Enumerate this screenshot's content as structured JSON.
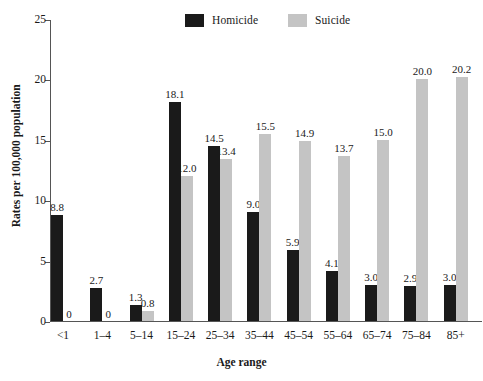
{
  "chart_data": {
    "type": "bar",
    "title": "",
    "subtitle": "",
    "xlabel": "Age range",
    "ylabel": "Rates per 100,000 population",
    "categories": [
      "<1",
      "1–4",
      "5–14",
      "15–24",
      "25–34",
      "35–44",
      "45–54",
      "55–64",
      "65–74",
      "75–84",
      "85+"
    ],
    "series": [
      {
        "name": "Homicide",
        "color": "#1a1a1a",
        "values": [
          8.8,
          2.7,
          1.3,
          18.1,
          14.5,
          9.0,
          5.9,
          4.1,
          3.0,
          2.9,
          3.0
        ],
        "labels": [
          "8.8",
          "2.7",
          "1.3",
          "18.1",
          "14.5",
          "9.0",
          "5.9",
          "4.1",
          "3.0",
          "2.9",
          "3.0"
        ]
      },
      {
        "name": "Suicide",
        "color": "#c4c4c4",
        "values": [
          0,
          0,
          0.8,
          12.0,
          13.4,
          15.5,
          14.9,
          13.7,
          15.0,
          20.0,
          20.2
        ],
        "labels": [
          "0",
          "0",
          "0.8",
          "12.0",
          "13.4",
          "15.5",
          "14.9",
          "13.7",
          "15.0",
          "20.0",
          "20.2"
        ]
      }
    ],
    "ylim": [
      0,
      25
    ],
    "yticks": [
      0,
      5,
      10,
      15,
      20,
      25
    ],
    "ytick_labels": [
      "0",
      "5",
      "10",
      "15",
      "20",
      "25"
    ],
    "grid": false,
    "legend_position": "top-center"
  },
  "legend": {
    "entries": [
      {
        "label": "Homicide",
        "color": "#1a1a1a"
      },
      {
        "label": "Suicide",
        "color": "#c4c4c4"
      }
    ]
  }
}
